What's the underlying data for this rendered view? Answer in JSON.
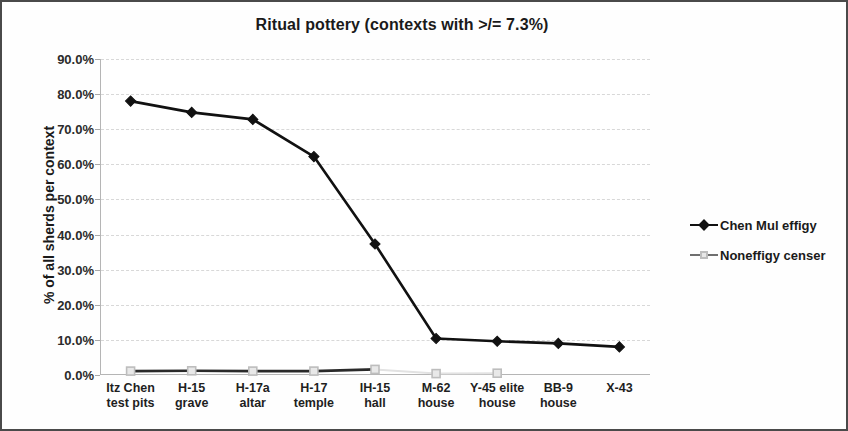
{
  "chart_data": {
    "type": "line",
    "title": "Ritual pottery (contexts with >/= 7.3%)",
    "xlabel": "",
    "ylabel": "% of all sherds per context",
    "ylim": [
      0,
      90
    ],
    "ytick_labels": [
      "90.0%",
      "80.0%",
      "70.0%",
      "60.0%",
      "50.0%",
      "40.0%",
      "30.0%",
      "20.0%",
      "10.0%",
      "0.0%"
    ],
    "ytick_values": [
      90,
      80,
      70,
      60,
      50,
      40,
      30,
      20,
      10,
      0
    ],
    "grid": true,
    "legend_position": "right",
    "categories": [
      "Itz Chen test pits",
      "H-15 grave",
      "H-17a altar",
      "H-17 temple",
      "IH-15 hall",
      "M-62 house",
      "Y-45 elite house",
      "BB-9 house",
      "X-43"
    ],
    "category_lines": [
      [
        "Itz Chen",
        "test pits"
      ],
      [
        "H-15",
        "grave"
      ],
      [
        "H-17a",
        "altar"
      ],
      [
        "H-17",
        "temple"
      ],
      [
        "IH-15",
        "hall"
      ],
      [
        "M-62",
        "house"
      ],
      [
        "Y-45 elite",
        "house"
      ],
      [
        "BB-9",
        "house"
      ],
      [
        "X-43",
        ""
      ]
    ],
    "series": [
      {
        "name": "Chen Mul effigy",
        "color": "#111111",
        "marker": "diamond",
        "values": [
          78.0,
          74.8,
          72.8,
          62.2,
          37.3,
          10.4,
          9.6,
          9.0,
          8.0
        ]
      },
      {
        "name": "Noneffigy censer",
        "color": "#bdbdbd",
        "marker": "square",
        "values": [
          1.1,
          1.2,
          1.1,
          1.1,
          1.6,
          0.4,
          0.5,
          null,
          null
        ]
      }
    ]
  },
  "legend": {
    "items": [
      {
        "label": "Chen Mul effigy"
      },
      {
        "label": "Noneffigy censer"
      }
    ]
  },
  "colors": {
    "effigy_line": "#111111",
    "noneffigy_line": "#bdbdbd",
    "gridline": "#d8d8d8",
    "axis": "#b5b5b5",
    "text": "#1a1a1a",
    "frame": "#4a4a4a"
  }
}
